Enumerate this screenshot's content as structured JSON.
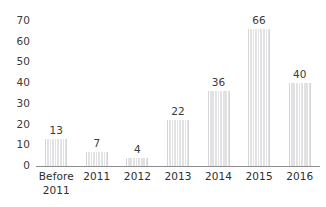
{
  "chart_data": {
    "type": "bar",
    "title": "",
    "subtitle": "",
    "xlabel": "",
    "ylabel": "",
    "categories": [
      "Before\n2011",
      "2011",
      "2012",
      "2013",
      "2014",
      "2015",
      "2016"
    ],
    "category_lines": [
      [
        "Before",
        "2011"
      ],
      [
        "2011"
      ],
      [
        "2012"
      ],
      [
        "2013"
      ],
      [
        "2014"
      ],
      [
        "2015"
      ],
      [
        "2016"
      ]
    ],
    "values": [
      13,
      7,
      4,
      22,
      36,
      66,
      40
    ],
    "value_labels": [
      "13",
      "7",
      "4",
      "22",
      "36",
      "66",
      "40"
    ],
    "ylim": [
      0,
      70
    ],
    "ytick_values": [
      0,
      10,
      20,
      30,
      40,
      50,
      60,
      70
    ],
    "ytick_labels": [
      "0",
      "10",
      "20",
      "30",
      "40",
      "50",
      "60",
      "70"
    ],
    "grid": false,
    "legend": false,
    "legend_position": "none",
    "show_value_labels": true,
    "bar_fill_color": "#e6e6e8",
    "bar_stripe_color": "#ffffff",
    "axis_color": "#8d8d8f",
    "text_color": "#3a3a3a",
    "background_color": "#ffffff"
  }
}
